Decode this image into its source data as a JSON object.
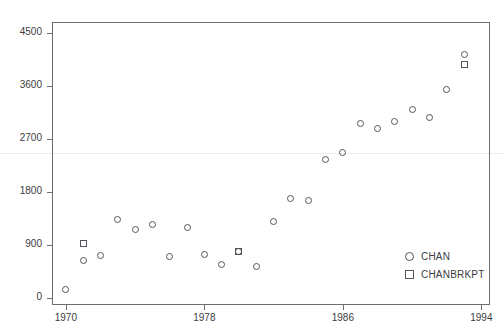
{
  "chart_data": {
    "type": "scatter",
    "title": "",
    "xlabel": "",
    "ylabel": "",
    "xlim": [
      1969.2,
      1994.5
    ],
    "ylim": [
      -120,
      4680
    ],
    "xticks": [
      1970,
      1978,
      1986,
      1994
    ],
    "yticks": [
      0,
      900,
      1800,
      2700,
      3600,
      4500
    ],
    "xtick_labels": [
      "1970",
      "1978",
      "1986",
      "1994"
    ],
    "ytick_labels": [
      "0",
      "900",
      "1800",
      "2700",
      "3600",
      "4500"
    ],
    "grid": "single faint horizontal reference line at y=2450",
    "gridline_value": 2450,
    "legend_position": "bottom-right inside axes",
    "series": [
      {
        "name": "CHAN",
        "marker": "circle",
        "color": "#55555b",
        "points": [
          {
            "x": 1970,
            "y": 150
          },
          {
            "x": 1971,
            "y": 640
          },
          {
            "x": 1972,
            "y": 720
          },
          {
            "x": 1973,
            "y": 1330
          },
          {
            "x": 1974,
            "y": 1160
          },
          {
            "x": 1975,
            "y": 1240
          },
          {
            "x": 1976,
            "y": 700
          },
          {
            "x": 1977,
            "y": 1190
          },
          {
            "x": 1978,
            "y": 740
          },
          {
            "x": 1979,
            "y": 560
          },
          {
            "x": 1980,
            "y": 780
          },
          {
            "x": 1981,
            "y": 540
          },
          {
            "x": 1982,
            "y": 1300
          },
          {
            "x": 1983,
            "y": 1690
          },
          {
            "x": 1984,
            "y": 1660
          },
          {
            "x": 1985,
            "y": 2340
          },
          {
            "x": 1986,
            "y": 2470
          },
          {
            "x": 1987,
            "y": 2950
          },
          {
            "x": 1988,
            "y": 2870
          },
          {
            "x": 1989,
            "y": 2990
          },
          {
            "x": 1990,
            "y": 3190
          },
          {
            "x": 1991,
            "y": 3060
          },
          {
            "x": 1992,
            "y": 3530
          },
          {
            "x": 1993,
            "y": 4130
          }
        ]
      },
      {
        "name": "CHANBRKPT",
        "marker": "square",
        "color": "#55555b",
        "points": [
          {
            "x": 1971,
            "y": 930
          },
          {
            "x": 1980,
            "y": 790
          },
          {
            "x": 1993,
            "y": 3960
          }
        ]
      }
    ]
  },
  "legend": {
    "entries": [
      {
        "label": "CHAN",
        "marker": "circle"
      },
      {
        "label": "CHANBRKPT",
        "marker": "square"
      }
    ]
  },
  "colors": {
    "frame": "#6e6e72",
    "marker": "#55555b",
    "text": "#3c3c41",
    "gridline": "#ededf0",
    "background": "#ffffff"
  }
}
